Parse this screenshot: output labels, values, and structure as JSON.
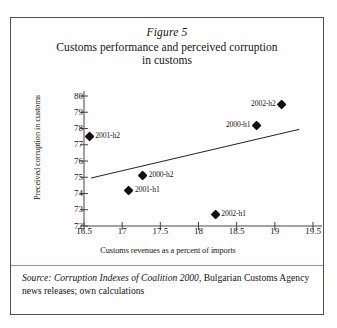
{
  "figure": {
    "number": "Figure 5",
    "title_line_1": "Customs performance and perceived corruption",
    "title_line_2": "in customs"
  },
  "source": {
    "prefix": "Source: ",
    "italic_part": "Corruption Indexes of Coalition 2000",
    "rest": ", Bulgarian Customs Agency news releases; own calculations"
  },
  "chart_data": {
    "type": "scatter",
    "title": "Customs performance and perceived corruption in customs",
    "subtitle": "Figure 5",
    "xlabel": "Customs revenues as a percent of imports",
    "ylabel": "Preceived corruption in customs",
    "xlim": [
      16.5,
      19.5
    ],
    "ylim": [
      72,
      80
    ],
    "xticks": [
      "16.5",
      "17",
      "17.5",
      "18",
      "18.5",
      "19",
      "19.5"
    ],
    "xtick_values": [
      16.5,
      17,
      17.5,
      18,
      18.5,
      19,
      19.5
    ],
    "yticks": [
      "72",
      "73",
      "74",
      "75",
      "76",
      "77",
      "78",
      "79",
      "80"
    ],
    "ytick_values": [
      72,
      73,
      74,
      75,
      76,
      77,
      78,
      79,
      80
    ],
    "grid": false,
    "legend": "none",
    "marker_shape": "diamond",
    "marker_color": "#111111",
    "points": [
      {
        "label": "2001-h2",
        "x": 16.57,
        "y": 77.5,
        "label_side": "right"
      },
      {
        "label": "2001-h1",
        "x": 17.09,
        "y": 74.2,
        "label_side": "right"
      },
      {
        "label": "2000-h2",
        "x": 17.27,
        "y": 75.1,
        "label_side": "right"
      },
      {
        "label": "2002-h1",
        "x": 18.22,
        "y": 72.7,
        "label_side": "right"
      },
      {
        "label": "2000-h1",
        "x": 18.76,
        "y": 78.2,
        "label_side": "left"
      },
      {
        "label": "2002-h2",
        "x": 19.09,
        "y": 79.5,
        "label_side": "left"
      }
    ],
    "trendline": {
      "type": "linear",
      "x_start": 16.59,
      "y_start": 74.95,
      "x_end": 19.32,
      "y_end": 77.95
    }
  }
}
